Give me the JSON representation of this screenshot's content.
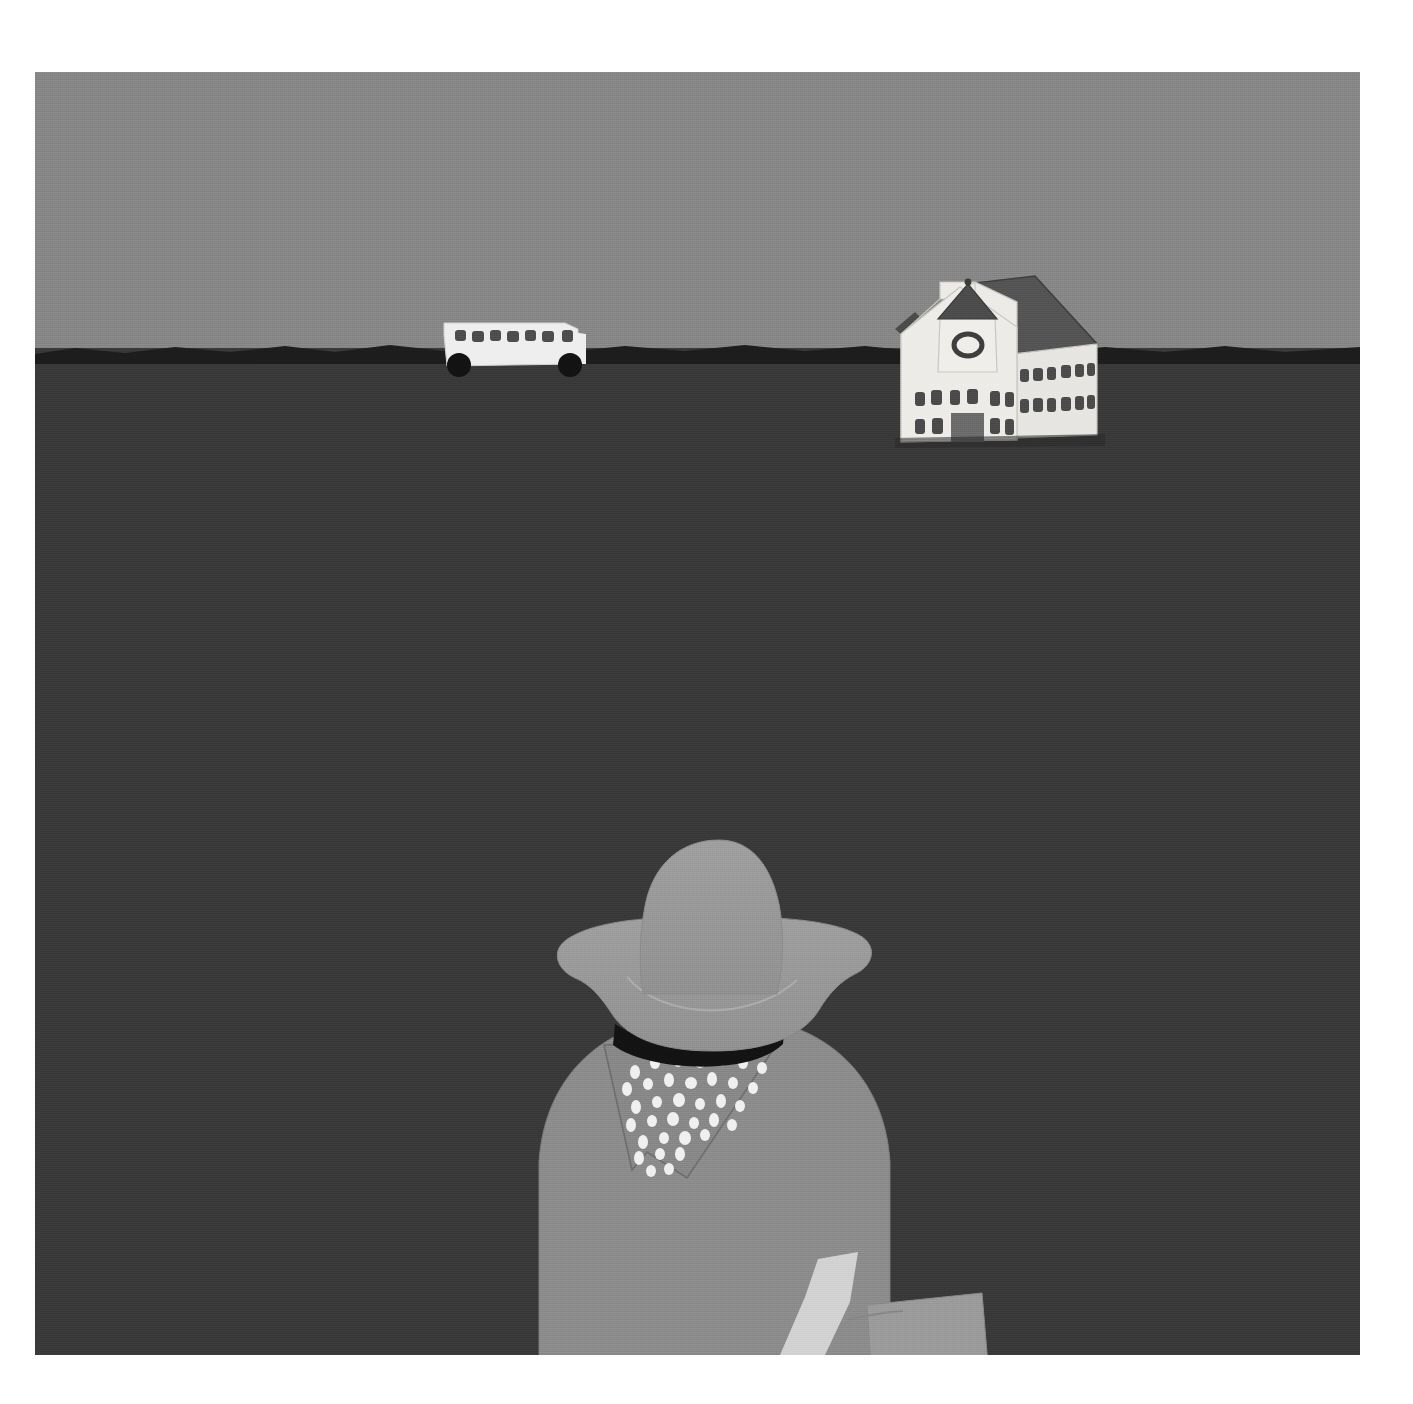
{
  "artwork": {
    "title": "Cowboy Child Facing Rural Schoolhouse",
    "medium": "painting",
    "style": "folk-art / naive",
    "canvas": {
      "x": 35,
      "y": 72,
      "width": 1325,
      "height": 1283
    },
    "page_background": "#ffffff"
  },
  "palette": {
    "sky": "#8a8a8a",
    "ground": "#3a3a3a",
    "horizon_band": "#1e1e1e",
    "building_wall": "#efefef",
    "building_wall_shade": "#dcdcdc",
    "roof_dark": "#4a4a4a",
    "roof_mid": "#5c5c5c",
    "window_dark": "#4a4a4a",
    "door": "#6e6e6e",
    "bus_body": "#f2f2f2",
    "bus_window": "#4f4f4f",
    "bus_wheel": "#141414",
    "hat": "#9a9a9a",
    "hat_brim": "#979797",
    "hat_band": "#141414",
    "shirt": "#8f8f8f",
    "bandana": "#8b8b8b",
    "bandana_spots": "#f4f4f4",
    "arm": "#d6d6d6",
    "satchel": "#9e9e9e",
    "outline": "#6a6a6a"
  },
  "scene": {
    "sky": {
      "label": "Overcast gray sky",
      "horizon_y_fraction": 0.22
    },
    "horizon": {
      "label": "Dark irregular horizon ridge"
    },
    "ground": {
      "label": "Dark flat prairie field"
    },
    "schoolhouse": {
      "label": "White one-room schoolhouse with belfry",
      "belfry": {
        "label": "Belfry tower with conical roof and round clock window",
        "clock": "round-window"
      },
      "facade": {
        "upper_windows": 6,
        "lower_windows": 4,
        "door": {
          "label": "Central gray door"
        }
      },
      "wing": {
        "label": "Side wing with dark gabled roof",
        "window_rows": 2,
        "windows_per_row": 6
      }
    },
    "school_bus": {
      "label": "Pale school bus on the horizon",
      "windows": 7,
      "wheels": 2,
      "direction": "facing-left"
    },
    "child": {
      "label": "Child seen from behind wearing cowboy hat",
      "hat": {
        "label": "Wide-brim cowboy hat",
        "band": "dark hatband"
      },
      "bandana": {
        "label": "Speckled bandana tied at neck",
        "spot_count": 44
      },
      "shirt": {
        "label": "Short-sleeve gray shirt"
      },
      "arms": {
        "left": "left arm at side",
        "right": "right arm holding satchel"
      },
      "satchel": {
        "label": "Book satchel / school bag carried at right side"
      }
    }
  },
  "bandana_spots": [
    [
      0.12,
      0.09
    ],
    [
      0.24,
      0.05
    ],
    [
      0.37,
      0.04
    ],
    [
      0.5,
      0.06
    ],
    [
      0.62,
      0.05
    ],
    [
      0.74,
      0.07
    ],
    [
      0.85,
      0.1
    ],
    [
      0.08,
      0.2
    ],
    [
      0.19,
      0.17
    ],
    [
      0.31,
      0.15
    ],
    [
      0.43,
      0.16
    ],
    [
      0.55,
      0.14
    ],
    [
      0.67,
      0.17
    ],
    [
      0.79,
      0.19
    ],
    [
      0.14,
      0.3
    ],
    [
      0.26,
      0.27
    ],
    [
      0.38,
      0.26
    ],
    [
      0.5,
      0.28
    ],
    [
      0.61,
      0.26
    ],
    [
      0.72,
      0.29
    ],
    [
      0.1,
      0.4
    ],
    [
      0.22,
      0.38
    ],
    [
      0.34,
      0.37
    ],
    [
      0.46,
      0.39
    ],
    [
      0.57,
      0.37
    ],
    [
      0.67,
      0.4
    ],
    [
      0.17,
      0.5
    ],
    [
      0.29,
      0.48
    ],
    [
      0.41,
      0.49
    ],
    [
      0.52,
      0.47
    ],
    [
      0.62,
      0.5
    ],
    [
      0.14,
      0.6
    ],
    [
      0.26,
      0.58
    ],
    [
      0.37,
      0.6
    ],
    [
      0.48,
      0.58
    ],
    [
      0.21,
      0.7
    ],
    [
      0.32,
      0.69
    ],
    [
      0.43,
      0.7
    ],
    [
      0.18,
      0.79
    ],
    [
      0.29,
      0.8
    ],
    [
      0.38,
      0.78
    ],
    [
      0.25,
      0.88
    ],
    [
      0.34,
      0.89
    ],
    [
      0.3,
      0.95
    ]
  ],
  "facade_upper_windows": [
    0.1,
    0.21,
    0.33,
    0.45,
    0.62,
    0.76
  ],
  "facade_lower_windows": [
    0.1,
    0.22,
    0.66,
    0.8
  ],
  "wing_windows_row1": [
    0.08,
    0.23,
    0.38,
    0.53,
    0.68,
    0.83
  ],
  "wing_windows_row2": [
    0.08,
    0.23,
    0.38,
    0.53,
    0.68,
    0.83
  ],
  "bus_windows": [
    0.06,
    0.16,
    0.26,
    0.36,
    0.46,
    0.56,
    0.66
  ]
}
